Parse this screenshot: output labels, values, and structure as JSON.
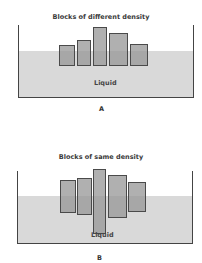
{
  "colors": {
    "liquid": "#d9d9d9",
    "block_fill": "#a8a8a8",
    "block_border": "#4a4a4a",
    "tank_border": "#444444"
  },
  "panelA": {
    "title": "Blocks of different density",
    "liquid_label": "Liquid",
    "caption": "A",
    "tank": {
      "left": 18,
      "top": 25,
      "width": 176,
      "height": 73
    },
    "liquid_top": 51,
    "blocks": [
      {
        "x": 59,
        "y": 45,
        "w": 16,
        "h": 21
      },
      {
        "x": 77,
        "y": 40,
        "w": 14,
        "h": 26
      },
      {
        "x": 93,
        "y": 27,
        "w": 14,
        "h": 39
      },
      {
        "x": 109,
        "y": 33,
        "w": 19,
        "h": 33
      },
      {
        "x": 130,
        "y": 44,
        "w": 18,
        "h": 22
      }
    ]
  },
  "panelB": {
    "title": "Blocks of same density",
    "liquid_label": "Liquid",
    "caption": "B",
    "tank": {
      "left": 17,
      "top": 171,
      "width": 176,
      "height": 73
    },
    "liquid_top": 196,
    "blocks": [
      {
        "x": 60,
        "y": 180,
        "w": 16,
        "h": 33
      },
      {
        "x": 77,
        "y": 178,
        "w": 15,
        "h": 37
      },
      {
        "x": 93,
        "y": 169,
        "w": 13,
        "h": 65
      },
      {
        "x": 108,
        "y": 175,
        "w": 19,
        "h": 43
      },
      {
        "x": 128,
        "y": 182,
        "w": 18,
        "h": 30
      }
    ]
  }
}
